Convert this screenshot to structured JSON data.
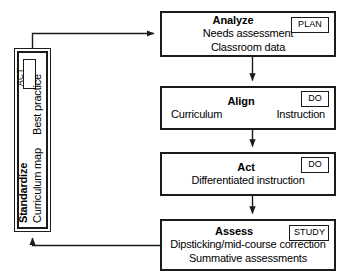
{
  "diagram": {
    "colors": {
      "stroke": "#1b1b1b",
      "background": "#ffffff",
      "text": "#000000"
    },
    "cycle_box": {
      "title": "Standardize",
      "badge": "ACT",
      "lines": [
        "Best practice",
        "Curriculum map"
      ],
      "orientation": "vertical-rotated-90"
    },
    "stages": [
      {
        "id": "analyze",
        "title": "Analyze",
        "badge": "PLAN",
        "lines": [
          "Needs assessment",
          "Classroom data"
        ]
      },
      {
        "id": "align",
        "title": "Align",
        "badge": "DO",
        "lines": [
          "Curriculum",
          "Instruction"
        ],
        "layout": "two-column"
      },
      {
        "id": "act",
        "title": "Act",
        "badge": "DO",
        "lines": [
          "Differentiated instruction"
        ]
      },
      {
        "id": "assess",
        "title": "Assess",
        "badge": "STUDY",
        "lines": [
          "Dipsticking/mid-course correction",
          "Summative assessments"
        ]
      }
    ],
    "connectors": [
      {
        "from": "standardize",
        "to": "analyze",
        "style": "elbow-up-right",
        "arrow": true
      },
      {
        "from": "analyze",
        "to": "align",
        "style": "straight-down",
        "arrow": true
      },
      {
        "from": "align",
        "to": "act",
        "style": "straight-down",
        "arrow": true
      },
      {
        "from": "act",
        "to": "assess",
        "style": "straight-down",
        "arrow": true
      },
      {
        "from": "assess",
        "to": "standardize",
        "style": "elbow-left-up",
        "arrow": true
      }
    ]
  }
}
